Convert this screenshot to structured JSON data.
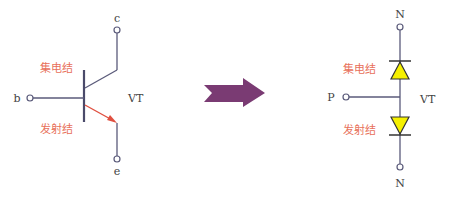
{
  "colors": {
    "wire": "#5a5a7a",
    "red_label": "#e8705a",
    "emitter_arrow": "#e05040",
    "arrow_fill": "#7a3b73",
    "diode_fill": "#f5f000",
    "text": "#333333"
  },
  "transistor": {
    "collector_label": "c",
    "emitter_label": "e",
    "base_label": "b",
    "device_label": "VT",
    "collector_junction_label": "集电结",
    "emitter_junction_label": "发射结"
  },
  "transform_arrow": {
    "icon": "right-arrow-icon"
  },
  "diode_model": {
    "top_label": "N",
    "bottom_label": "N",
    "middle_label": "P",
    "device_label": "VT",
    "collector_junction_label": "集电结",
    "emitter_junction_label": "发射结"
  }
}
